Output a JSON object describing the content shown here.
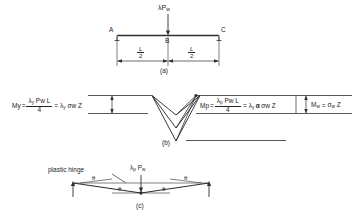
{
  "figure": {
    "caption_a": "(a)",
    "caption_b": "(b)",
    "caption_c": "(c)"
  },
  "panel_a": {
    "load_label": "λP",
    "load_label_sub": "w",
    "node_left": "A",
    "node_mid": "B",
    "node_right": "C",
    "dim_left_num": "L",
    "dim_left_den": "2",
    "dim_right_num": "L",
    "dim_right_den": "2"
  },
  "panel_b": {
    "eq_left_lhs": "My",
    "eq_left_lhs_sub": "y",
    "eq_left_equals": "=",
    "eq_left_num": "λ",
    "eq_left_num_sub": "y",
    "eq_left_num_rest": " Pw L",
    "eq_left_den": "4",
    "eq_left_equals2": "=",
    "eq_left_rhs": "λ",
    "eq_left_rhs_sub": "y",
    "eq_left_rhs_rest": " σw Z",
    "eq_mid_lhs": "Mp",
    "eq_mid_lhs_sub": "p",
    "eq_mid_equals": "=",
    "eq_mid_num": "λ",
    "eq_mid_num_sub": "p",
    "eq_mid_num_rest": " Pw L",
    "eq_mid_den": "4",
    "eq_mid_equals2": "=",
    "eq_mid_rhs": "λ",
    "eq_mid_rhs_sub": "y",
    "eq_mid_alpha": "α",
    "eq_mid_rhs_rest": " σw Z",
    "eq_right_lhs": "M",
    "eq_right_lhs_sub": "w",
    "eq_right_equals": "=",
    "eq_right_rhs": "σ",
    "eq_right_rhs_sub": "w",
    "eq_right_rhs_rest": " Z"
  },
  "panel_c": {
    "hinge_label": "plastic hinge",
    "load_label": "λ",
    "load_label_sub1": "p",
    "load_label_rest": " P",
    "load_label_sub2": "w",
    "theta_upper_left": "θ",
    "theta_upper_right": "θ",
    "theta_lower_left": "θ",
    "theta_lower_right": "θ"
  },
  "style": {
    "ink": "#242424",
    "line": "#3a3a3a",
    "bg": "#ffffff"
  }
}
